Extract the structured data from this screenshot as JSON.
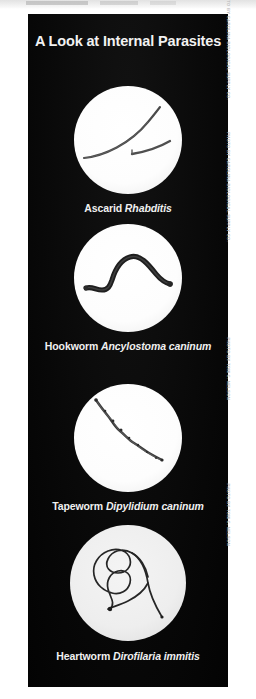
{
  "poster": {
    "title": "A Look at Internal Parasites",
    "background_color": "#0a0a0a",
    "text_color": "#f2f2f2",
    "specimens": [
      {
        "common_name": "Ascarid",
        "scientific_name": "Rhabditis",
        "image_name": "ascarid-photo",
        "credit": "Photo by Carolina Biological Supply Co."
      },
      {
        "common_name": "Hookworm",
        "scientific_name": "Ancylostoma caninum",
        "image_name": "hookworm-photo",
        "credit": "Photo by Carolina Biological Supply Co."
      },
      {
        "common_name": "Tapeworm",
        "scientific_name": "Dipylidium caninum",
        "image_name": "tapeworm-photo",
        "credit": "Photo by Tom C. Nelson"
      },
      {
        "common_name": "Heartworm",
        "scientific_name": "Dirofilaria immitis",
        "image_name": "heartworm-photo",
        "credit": "Photo by Tom C. Nelson"
      }
    ]
  }
}
